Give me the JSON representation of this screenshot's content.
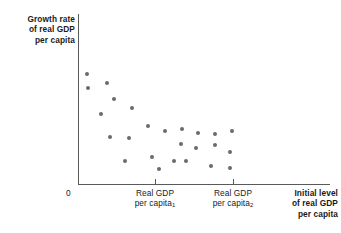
{
  "figure": {
    "background_color": "#ffffff",
    "axis_color": "#5a5a5a",
    "point_color": "#6a6a6a"
  },
  "axes": {
    "y_title": "Growth rate\nof real GDP\nper capita",
    "x_title": "Initial level\nof real GDP\nper capita",
    "origin_label": "0",
    "xtick_label_1_line1": "Real GDP",
    "xtick_label_1_line2": "per capita",
    "xtick_label_1_subscript": "1",
    "xtick_label_2_line1": "Real GDP",
    "xtick_label_2_line2": "per capita",
    "xtick_label_2_subscript": "2"
  },
  "chart_data": {
    "type": "scatter",
    "title": "",
    "xlabel": "Initial level of real GDP per capita",
    "ylabel": "Growth rate of real GDP per capita",
    "grid": false,
    "legend": "none",
    "xlim": [
      0,
      100
    ],
    "ylim": [
      0,
      100
    ],
    "xticks": [
      {
        "value": 30.6,
        "label": "Real GDP per capita₁"
      },
      {
        "value": 61.5,
        "label": "Real GDP per capita₂"
      }
    ],
    "yticks": [],
    "annotations": [],
    "series": [
      {
        "name": "countries",
        "n_points": 25,
        "description": "Negative (convergence) relationship: growth rate of real GDP per capita declines as initial level of real GDP per capita rises; scatter fans out and flattens at higher initial income.",
        "points": [
          {
            "x": 3.6,
            "y": 65.3
          },
          {
            "x": 11.5,
            "y": 59.6
          },
          {
            "x": 4.0,
            "y": 57.0
          },
          {
            "x": 14.3,
            "y": 50.3
          },
          {
            "x": 21.4,
            "y": 44.7
          },
          {
            "x": 9.1,
            "y": 41.2
          },
          {
            "x": 27.8,
            "y": 34.3
          },
          {
            "x": 12.7,
            "y": 27.9
          },
          {
            "x": 20.2,
            "y": 27.3
          },
          {
            "x": 34.5,
            "y": 31.4
          },
          {
            "x": 41.3,
            "y": 32.6
          },
          {
            "x": 47.6,
            "y": 30.2
          },
          {
            "x": 54.4,
            "y": 29.6
          },
          {
            "x": 61.1,
            "y": 31.4
          },
          {
            "x": 40.9,
            "y": 23.8
          },
          {
            "x": 46.8,
            "y": 21.5
          },
          {
            "x": 54.4,
            "y": 23.2
          },
          {
            "x": 60.3,
            "y": 19.2
          },
          {
            "x": 18.7,
            "y": 13.4
          },
          {
            "x": 29.4,
            "y": 15.7
          },
          {
            "x": 38.1,
            "y": 13.4
          },
          {
            "x": 42.9,
            "y": 13.4
          },
          {
            "x": 52.8,
            "y": 10.5
          },
          {
            "x": 32.1,
            "y": 8.7
          },
          {
            "x": 60.3,
            "y": 9.3
          }
        ]
      }
    ]
  },
  "points_px": [
    {
      "x": 87,
      "y": 74
    },
    {
      "x": 107,
      "y": 83
    },
    {
      "x": 88,
      "y": 88
    },
    {
      "x": 114,
      "y": 99
    },
    {
      "x": 132,
      "y": 108
    },
    {
      "x": 101,
      "y": 114
    },
    {
      "x": 148,
      "y": 126
    },
    {
      "x": 110,
      "y": 137
    },
    {
      "x": 129,
      "y": 138
    },
    {
      "x": 165,
      "y": 131
    },
    {
      "x": 182,
      "y": 129
    },
    {
      "x": 198,
      "y": 133
    },
    {
      "x": 215,
      "y": 134
    },
    {
      "x": 232,
      "y": 131
    },
    {
      "x": 181,
      "y": 144
    },
    {
      "x": 196,
      "y": 148
    },
    {
      "x": 215,
      "y": 145
    },
    {
      "x": 230,
      "y": 152
    },
    {
      "x": 125,
      "y": 161
    },
    {
      "x": 152,
      "y": 157
    },
    {
      "x": 174,
      "y": 161
    },
    {
      "x": 186,
      "y": 161
    },
    {
      "x": 211,
      "y": 166
    },
    {
      "x": 159,
      "y": 169
    },
    {
      "x": 230,
      "y": 168
    }
  ]
}
